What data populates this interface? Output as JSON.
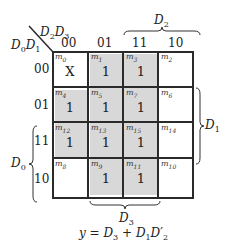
{
  "kmap": {
    "corner": {
      "row_vars": "D0D1",
      "col_vars": "D2D3"
    },
    "col_headers": [
      "00",
      "01",
      "11",
      "10"
    ],
    "row_headers": [
      "00",
      "01",
      "11",
      "10"
    ],
    "cells": [
      [
        {
          "minterm": "m0",
          "value": "X"
        },
        {
          "minterm": "m1",
          "value": "1"
        },
        {
          "minterm": "m3",
          "value": "1"
        },
        {
          "minterm": "m2",
          "value": ""
        }
      ],
      [
        {
          "minterm": "m4",
          "value": "1"
        },
        {
          "minterm": "m5",
          "value": "1"
        },
        {
          "minterm": "m7",
          "value": "1"
        },
        {
          "minterm": "m6",
          "value": ""
        }
      ],
      [
        {
          "minterm": "m12",
          "value": "1"
        },
        {
          "minterm": "m13",
          "value": "1"
        },
        {
          "minterm": "m15",
          "value": "1"
        },
        {
          "minterm": "m14",
          "value": ""
        }
      ],
      [
        {
          "minterm": "m8",
          "value": ""
        },
        {
          "minterm": "m9",
          "value": "1"
        },
        {
          "minterm": "m11",
          "value": "1"
        },
        {
          "minterm": "m10",
          "value": ""
        }
      ]
    ],
    "brace_labels": {
      "top": "D2",
      "right": "D1",
      "left": "D0",
      "bottom": "D3"
    },
    "groups": [
      {
        "name": "D3",
        "cells": [
          "m1",
          "m3",
          "m5",
          "m7",
          "m13",
          "m15",
          "m9",
          "m11"
        ]
      },
      {
        "name": "D1D2'",
        "cells": [
          "m4",
          "m5",
          "m12",
          "m13"
        ]
      }
    ],
    "shade_color": "#d8d8d8"
  },
  "equation": "y = D3 + D1D2'"
}
